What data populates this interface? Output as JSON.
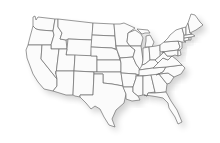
{
  "map": {
    "title": "United States",
    "fill_color": "#fbfbfb",
    "stroke_color": "#6f6f6f",
    "shadow": true,
    "states": [
      {
        "id": "WA",
        "path": "M33,17 L35,16 L36,20 L38,17 L55,19 L53,31 L40,30 L36,29 L33,26 Z"
      },
      {
        "id": "OR",
        "path": "M33,26 L36,29 L40,30 L53,31 L54,35 L51,45 L28,45 L30,37 Z"
      },
      {
        "id": "CA",
        "path": "M28,45 L42,45 L41,59 L57,79 L57,86 L53,91 L44,89 L38,82 L33,74 L27,58 L26,50 Z"
      },
      {
        "id": "ID",
        "path": "M55,19 L58,19 L58,27 L62,33 L60,39 L66,40 L67,49 L51,49 L51,45 L54,35 L53,31 Z"
      },
      {
        "id": "NV",
        "path": "M42,45 L51,45 L51,49 L59,49 L56,74 L57,79 L41,59 Z"
      },
      {
        "id": "MT",
        "path": "M58,19 L93,23 L92,40 L68,39 L66,40 L60,39 L62,33 L58,27 Z"
      },
      {
        "id": "WY",
        "path": "M68,39 L92,40 L91,56 L66,55 L67,49 Z"
      },
      {
        "id": "UT",
        "path": "M59,49 L67,49 L66,55 L75,55 L74,71 L56,71 L56,74 Z"
      },
      {
        "id": "AZ",
        "path": "M56,71 L74,71 L73,95 L66,95 L53,91 L57,86 L57,79 L56,74 Z"
      },
      {
        "id": "CO",
        "path": "M75,55 L97,56 L97,72 L74,71 Z"
      },
      {
        "id": "NM",
        "path": "M74,71 L94,72 L93,95 L80,95 L80,97 L75,96 L73,95 Z"
      },
      {
        "id": "ND",
        "path": "M93,23 L114,24 L115,36 L92,35 Z"
      },
      {
        "id": "SD",
        "path": "M92,35 L115,36 L116,49 L112,48 L91,47 Z"
      },
      {
        "id": "NE",
        "path": "M91,47 L112,48 L117,50 L120,60 L97,60 L97,56 L91,56 Z"
      },
      {
        "id": "KS",
        "path": "M97,60 L120,60 L121,63 L121,72 L97,72 Z"
      },
      {
        "id": "OK",
        "path": "M94,72 L121,72 L123,86 L112,84 L103,83 L103,74 L94,74 Z"
      },
      {
        "id": "TX",
        "path": "M94,74 L103,74 L103,83 L112,84 L123,86 L126,94 L124,103 L116,110 L112,119 L115,127 L109,125 L104,117 L100,109 L95,106 L91,109 L86,103 L80,97 L80,95 L93,95 Z"
      },
      {
        "id": "MN",
        "path": "M114,24 L120,24 L124,23 L135,28 L128,33 L127,42 L130,46 L116,46 L115,36 Z"
      },
      {
        "id": "IA",
        "path": "M116,46 L130,46 L135,50 L133,57 L120,58 L117,50 Z"
      },
      {
        "id": "MO",
        "path": "M120,58 L133,57 L136,64 L141,71 L139,75 L136,74 L121,73 L121,63 Z"
      },
      {
        "id": "AR",
        "path": "M121,73 L136,74 L136,78 L133,87 L123,87 L123,86 Z"
      },
      {
        "id": "LA",
        "path": "M123,87 L133,87 L133,92 L138,96 L140,100 L132,101 L126,99 L126,94 Z"
      },
      {
        "id": "WI",
        "path": "M128,33 L135,30 L141,34 L143,38 L141,46 L130,46 L127,42 Z"
      },
      {
        "id": "IL",
        "path": "M130,46 L141,46 L143,60 L142,67 L141,71 L136,64 L133,57 L135,50 Z"
      },
      {
        "id": "MI",
        "path": "M137,29 L148,30 L150,33 L145,33 L142,34 Z M146,36 L150,35 L154,42 L152,47 L145,47 L146,41 Z"
      },
      {
        "id": "IN",
        "path": "M143,48 L149,47 L150,60 L145,64 L142,65 L143,60 Z"
      },
      {
        "id": "OH",
        "path": "M149,47 L156,46 L160,45 L160,56 L155,60 L150,60 Z"
      },
      {
        "id": "KY",
        "path": "M142,65 L145,64 L150,60 L155,60 L158,63 L153,68 L139,70 L141,67 Z"
      },
      {
        "id": "TN",
        "path": "M139,70 L153,68 L166,67 L163,72 L156,75 L137,76 L139,75 Z"
      },
      {
        "id": "MS",
        "path": "M136,76 L143,76 L143,95 L138,96 L133,92 L133,87 L136,78 Z"
      },
      {
        "id": "AL",
        "path": "M143,76 L151,75 L155,92 L148,93 L147,96 L144,95 L143,95 Z"
      },
      {
        "id": "GA",
        "path": "M151,75 L159,74 L163,79 L167,84 L166,92 L155,93 L155,92 Z"
      },
      {
        "id": "FL",
        "path": "M144,95 L147,96 L148,93 L155,93 L166,92 L166,92 L171,101 L177,110 L182,122 L178,124 L175,117 L169,108 L168,103 L163,98 L158,97 L152,96 Z"
      },
      {
        "id": "SC",
        "path": "M159,74 L168,73 L174,77 L170,83 L167,84 L163,79 Z"
      },
      {
        "id": "NC",
        "path": "M163,72 L166,67 L182,65 L185,68 L181,74 L174,77 L168,73 L159,74 L156,75 Z"
      },
      {
        "id": "VA",
        "path": "M158,63 L163,58 L168,60 L172,56 L177,60 L182,65 L166,67 L153,68 Z"
      },
      {
        "id": "WV",
        "path": "M160,56 L164,52 L167,56 L172,56 L168,60 L163,58 L158,63 L155,60 Z"
      },
      {
        "id": "PA",
        "path": "M160,45 L164,42 L178,41 L180,47 L178,50 L162,52 L160,51 Z"
      },
      {
        "id": "MD",
        "path": "M162,52 L178,50 L178,56 L175,55 L172,56 L167,56 L164,52 Z"
      },
      {
        "id": "DE",
        "path": "M178,50 L180,50 L181,55 L178,56 Z"
      },
      {
        "id": "NJ",
        "path": "M178,41 L182,42 L182,48 L180,50 L178,50 L180,47 Z"
      },
      {
        "id": "NY",
        "path": "M164,42 L168,38 L170,35 L176,30 L182,28 L184,35 L184,41 L186,42 L182,42 L178,41 Z"
      },
      {
        "id": "CT",
        "path": "M184,38 L189,37 L189,40 L184,41 Z"
      },
      {
        "id": "RI",
        "path": "M189,37 L191,37 L191,40 L189,40 Z"
      },
      {
        "id": "MA",
        "path": "M184,35 L192,34 L195,36 L191,37 L184,38 Z"
      },
      {
        "id": "VT",
        "path": "M182,28 L186,27 L186,35 L184,35 Z"
      },
      {
        "id": "NH",
        "path": "M186,27 L188,23 L190,33 L192,34 L186,35 Z"
      },
      {
        "id": "ME",
        "path": "M188,23 L191,14 L195,15 L200,22 L203,25 L196,30 L190,33 Z"
      }
    ]
  }
}
